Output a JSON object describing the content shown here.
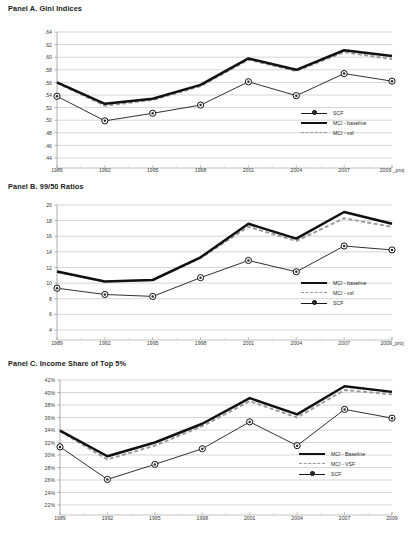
{
  "figure": {
    "background": "#ffffff",
    "series_colors": {
      "baseline": "#111111",
      "vsf": "#9a9a9a",
      "scf": "#1a1a1a"
    }
  },
  "panels": [
    {
      "id": "A",
      "title": "Panel A. Gini Indices",
      "legend_position": "inside-right-lower",
      "legend": [
        {
          "label": "SCF",
          "key": "marker"
        },
        {
          "label": "MCI - baseline",
          "key": "solid"
        },
        {
          "label": "MCI - vsf",
          "key": "dash"
        }
      ],
      "chart_data": {
        "type": "line",
        "title": "Panel A. Gini Indices",
        "xlabel": "",
        "ylabel": "",
        "categories": [
          "1989",
          "1992",
          "1995",
          "1998",
          "2001",
          "2004",
          "2007",
          "2009 _proj"
        ],
        "yticks": [
          ".44",
          ".46",
          ".48",
          ".50",
          ".52",
          ".54",
          ".56",
          ".58",
          ".60",
          ".62",
          ".64"
        ],
        "ylim": [
          0.44,
          0.64
        ],
        "grid": true,
        "legend_position": "inside-right-lower",
        "series": [
          {
            "name": "SCF",
            "style": "line-marker",
            "values": [
              0.538,
              0.499,
              0.511,
              0.524,
              0.561,
              0.539,
              0.574,
              0.562
            ]
          },
          {
            "name": "MCI - baseline",
            "style": "thick-solid",
            "values": [
              0.56,
              0.526,
              0.534,
              0.556,
              0.598,
              0.58,
              0.611,
              0.602
            ]
          },
          {
            "name": "MCI - vsf",
            "style": "dashed",
            "values": [
              0.559,
              0.523,
              0.532,
              0.554,
              0.596,
              0.578,
              0.608,
              0.597
            ]
          }
        ]
      }
    },
    {
      "id": "B",
      "title": "Panel B. 99/50 Ratios",
      "legend_position": "inside-right-lower",
      "legend": [
        {
          "label": "MCI - baseline",
          "key": "solid"
        },
        {
          "label": "MCI - vsf",
          "key": "dash"
        },
        {
          "label": "SCF",
          "key": "marker"
        }
      ],
      "chart_data": {
        "type": "line",
        "title": "Panel B. 99/50 Ratios",
        "xlabel": "",
        "ylabel": "",
        "categories": [
          "1989",
          "1992",
          "1995",
          "1998",
          "2001",
          "2004",
          "2007",
          "2009_proj"
        ],
        "yticks": [
          "4",
          "6",
          "8",
          "10",
          "12",
          "14",
          "16",
          "18",
          "20"
        ],
        "ylim": [
          4,
          20
        ],
        "grid": true,
        "legend_position": "inside-right-lower",
        "series": [
          {
            "name": "MCI - baseline",
            "style": "thick-solid",
            "values": [
              11.5,
              10.2,
              10.4,
              13.3,
              17.6,
              15.7,
              19.1,
              17.6
            ]
          },
          {
            "name": "MCI - vsf",
            "style": "dashed",
            "values": [
              11.4,
              10.2,
              10.4,
              13.2,
              17.2,
              15.4,
              18.3,
              17.2
            ]
          },
          {
            "name": "SCF",
            "style": "line-marker",
            "values": [
              9.35,
              8.55,
              8.3,
              10.7,
              12.9,
              11.45,
              14.75,
              14.25
            ]
          }
        ]
      }
    },
    {
      "id": "C",
      "title": "Panel C. Income Share of Top 5%",
      "legend_position": "inside-right-lower",
      "legend": [
        {
          "label": "MCI - Baseline",
          "key": "solid"
        },
        {
          "label": "MCI - VSF",
          "key": "dash"
        },
        {
          "label": "SCF",
          "key": "marker"
        }
      ],
      "chart_data": {
        "type": "line",
        "title": "Panel C. Income Share of Top 5%",
        "xlabel": "",
        "ylabel": "",
        "categories": [
          "1989",
          "1992",
          "1995",
          "1998",
          "2001",
          "2004",
          "2007",
          "2009"
        ],
        "yticks": [
          "22%",
          "24%",
          "26%",
          "28%",
          "30%",
          "32%",
          "34%",
          "36%",
          "38%",
          "40%",
          "42%"
        ],
        "ylim": [
          22,
          42
        ],
        "grid": true,
        "legend_position": "inside-right-lower",
        "series": [
          {
            "name": "MCI - Baseline",
            "style": "thick-solid",
            "values": [
              33.9,
              29.8,
              32.0,
              35.0,
              39.1,
              36.5,
              41.0,
              40.1
            ]
          },
          {
            "name": "MCI - VSF",
            "style": "dashed",
            "values": [
              33.8,
              29.3,
              31.5,
              34.6,
              38.6,
              36.0,
              40.4,
              39.7
            ]
          },
          {
            "name": "SCF",
            "style": "line-marker",
            "values": [
              31.3,
              26.1,
              28.5,
              31.0,
              35.3,
              31.5,
              37.3,
              35.9
            ]
          }
        ]
      }
    }
  ]
}
